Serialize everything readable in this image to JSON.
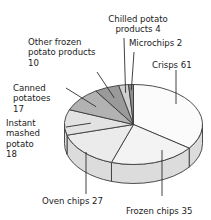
{
  "chart_data": {
    "type": "pie",
    "title": "",
    "subtitle": "",
    "xlabel": "",
    "ylabel": "",
    "total": 174,
    "units": "",
    "legend": "none",
    "grid": false,
    "style": "3d-pie-exploded-none",
    "start_angle_deg": 0,
    "direction": "clockwise",
    "categories": [
      "Crisps",
      "Frozen chips",
      "Oven chips",
      "Instant mashed potato",
      "Canned potatoes",
      "Other frozen potato products",
      "Chilled potato products",
      "Microchips"
    ],
    "values": [
      61,
      35,
      27,
      18,
      17,
      10,
      4,
      2
    ],
    "slice_colors": [
      "#fbfbfb",
      "#f3f3f3",
      "#ebebeb",
      "#e2e2e2",
      "#b2b2b2",
      "#9a9a9a",
      "#cfcfcf",
      "#8e8e8e"
    ],
    "annotations": [
      "Crisps 61",
      "Frozen chips 35",
      "Oven chips 27",
      "Instant mashed potato 18",
      "Canned potatoes 17",
      "Other frozen potato products 10",
      "Chilled potato products 4",
      "Microchips 2"
    ]
  },
  "labels": {
    "chilled_potato_products": "Chilled potato\nproducts 4",
    "microchips": "Microchips 2",
    "crisps": "Crisps 61",
    "other_frozen_potato_products": "Other frozen\npotato products\n10",
    "canned_potatoes": "Canned\npotatoes\n17",
    "instant_mashed_potato": "Instant\nmashed\npotato\n18",
    "oven_chips": "Oven chips 27",
    "frozen_chips": "Frozen chips 35"
  },
  "colors": {
    "outline": "#3b3b3b",
    "leader": "#2e2e2e",
    "side_wall": "#dcdcdc",
    "background": "#ffffff",
    "text": "#1b1b1b"
  }
}
